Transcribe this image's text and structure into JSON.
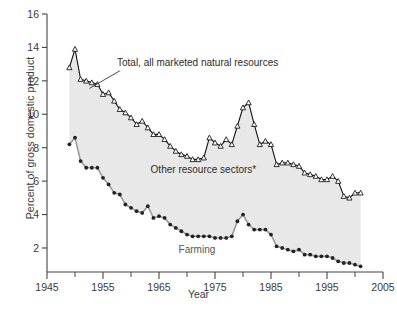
{
  "chart_data": {
    "type": "line",
    "title": "",
    "xlabel": "Year",
    "ylabel": "Percent of gross domestic product",
    "xlim": [
      1945,
      2005
    ],
    "ylim": [
      0,
      16
    ],
    "xticks": [
      1945,
      1955,
      1965,
      1975,
      1985,
      1995,
      2005
    ],
    "xtick_labels": [
      "1945",
      "1955",
      "1965",
      "1975",
      "1985",
      "1995",
      "2005"
    ],
    "xminor_ticks": [
      1950,
      1960,
      1970,
      1980,
      1990,
      2000
    ],
    "yticks": [
      0,
      2,
      4,
      6,
      8,
      10,
      12,
      14,
      16
    ],
    "ytick_labels": [
      "",
      "2",
      "4",
      "6",
      "8",
      "10",
      "12",
      "14",
      "16"
    ],
    "grid": false,
    "legend_position": "inline-annotations",
    "fill_between": true,
    "fill_color": "#e8e8e8",
    "annotations": [
      {
        "name": "total-label",
        "text": "Total, all marketed natural resources",
        "x": 1957.5,
        "y": 12.9,
        "anchor": "start"
      },
      {
        "name": "other-label",
        "text": "Other resource sectors*",
        "x": 1963.5,
        "y": 6.5,
        "anchor": "start"
      },
      {
        "name": "farming-label",
        "text": "Farming",
        "x": 1968.5,
        "y": 1.7,
        "anchor": "start"
      }
    ],
    "leader_line": {
      "name": "total-leader-line",
      "x1": 1958.0,
      "y1": 12.6,
      "x2": 1952.6,
      "y2": 11.55
    },
    "series": [
      {
        "name": "Total, all marketed natural resources",
        "marker": "triangle-open",
        "color": "#1a1a1a",
        "x": [
          1949,
          1950,
          1951,
          1952,
          1953,
          1954,
          1955,
          1956,
          1957,
          1958,
          1959,
          1960,
          1961,
          1962,
          1963,
          1964,
          1965,
          1966,
          1967,
          1968,
          1969,
          1970,
          1971,
          1972,
          1973,
          1974,
          1975,
          1976,
          1977,
          1978,
          1979,
          1980,
          1981,
          1982,
          1983,
          1984,
          1985,
          1986,
          1987,
          1988,
          1989,
          1990,
          1991,
          1992,
          1993,
          1994,
          1995,
          1996,
          1997,
          1998,
          1999,
          2000,
          2001
        ],
        "values": [
          12.8,
          13.9,
          12.1,
          12.0,
          11.9,
          11.8,
          11.2,
          11.3,
          10.8,
          10.3,
          10.1,
          9.8,
          9.4,
          9.6,
          9.2,
          8.8,
          8.8,
          8.5,
          8.1,
          7.8,
          7.6,
          7.5,
          7.3,
          7.3,
          7.4,
          8.6,
          8.3,
          8.1,
          8.5,
          8.2,
          9.3,
          10.4,
          10.7,
          9.4,
          8.2,
          8.4,
          8.2,
          7.0,
          7.1,
          7.1,
          7.0,
          6.9,
          6.5,
          6.4,
          6.3,
          6.1,
          6.1,
          6.3,
          6.0,
          5.1,
          5.0,
          5.3,
          5.3
        ]
      },
      {
        "name": "Farming",
        "marker": "circle-filled",
        "color": "#1a1a1a",
        "x": [
          1949,
          1950,
          1951,
          1952,
          1953,
          1954,
          1955,
          1956,
          1957,
          1958,
          1959,
          1960,
          1961,
          1962,
          1963,
          1964,
          1965,
          1966,
          1967,
          1968,
          1969,
          1970,
          1971,
          1972,
          1973,
          1974,
          1975,
          1976,
          1977,
          1978,
          1979,
          1980,
          1981,
          1982,
          1983,
          1984,
          1985,
          1986,
          1987,
          1988,
          1989,
          1990,
          1991,
          1992,
          1993,
          1994,
          1995,
          1996,
          1997,
          1998,
          1999,
          2000,
          2001
        ],
        "values": [
          8.2,
          8.6,
          7.2,
          6.8,
          6.8,
          6.8,
          6.2,
          5.8,
          5.3,
          5.2,
          4.6,
          4.4,
          4.2,
          4.1,
          4.5,
          3.8,
          3.9,
          3.8,
          3.4,
          3.2,
          3.0,
          2.8,
          2.7,
          2.7,
          2.7,
          2.7,
          2.6,
          2.6,
          2.6,
          2.7,
          3.6,
          4.0,
          3.4,
          3.1,
          3.1,
          3.1,
          2.8,
          2.1,
          2.0,
          1.9,
          1.8,
          1.9,
          1.6,
          1.6,
          1.5,
          1.5,
          1.5,
          1.4,
          1.2,
          1.1,
          1.1,
          1.0,
          0.9
        ]
      }
    ]
  },
  "axis": {
    "y_title": "Percent of gross domestic product",
    "x_title": "Year"
  }
}
